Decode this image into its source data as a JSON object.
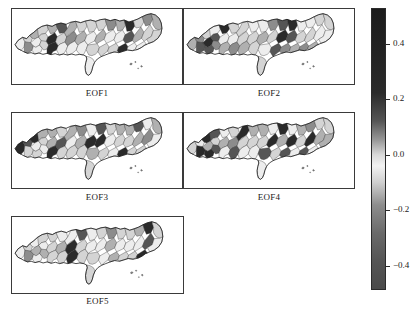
{
  "figure": {
    "width": 416,
    "height": 311,
    "background": "#ffffff"
  },
  "panels": [
    {
      "id": "eof1",
      "label": "EOF1",
      "frame": {
        "x": 11,
        "y": 8,
        "w": 172,
        "h": 77
      },
      "label_pos": {
        "x": 11,
        "y": 88,
        "w": 172
      }
    },
    {
      "id": "eof2",
      "label": "EOF2",
      "frame": {
        "x": 183,
        "y": 8,
        "w": 172,
        "h": 77
      },
      "label_pos": {
        "x": 183,
        "y": 88,
        "w": 172
      }
    },
    {
      "id": "eof3",
      "label": "EOF3",
      "frame": {
        "x": 11,
        "y": 112,
        "w": 172,
        "h": 77
      },
      "label_pos": {
        "x": 11,
        "y": 192,
        "w": 172
      }
    },
    {
      "id": "eof4",
      "label": "EOF4",
      "frame": {
        "x": 183,
        "y": 112,
        "w": 172,
        "h": 77
      },
      "label_pos": {
        "x": 183,
        "y": 192,
        "w": 172
      }
    },
    {
      "id": "eof5",
      "label": "EOF5",
      "frame": {
        "x": 11,
        "y": 216,
        "w": 173,
        "h": 78
      },
      "label_pos": {
        "x": 11,
        "y": 296,
        "w": 173
      }
    }
  ],
  "chart_data": {
    "type": "heatmap",
    "title": "",
    "xlabel": "",
    "ylabel": "",
    "panel_labels": [
      "EOF1",
      "EOF2",
      "EOF3",
      "EOF4",
      "EOF5"
    ],
    "colorbar": {
      "orientation": "vertical",
      "position": "right",
      "vmin": -0.49,
      "vmax": 0.53,
      "ticks": [
        0.4,
        0.2,
        0.0,
        -0.2,
        -0.4
      ],
      "tick_labels": [
        "0.4",
        "0.2",
        "0.0",
        "−0.2",
        "−0.4"
      ],
      "tick_y": [
        44,
        99,
        155,
        210,
        266
      ],
      "bar": {
        "x": 371,
        "y": 8,
        "w": 15,
        "h": 282
      },
      "colormap": "diverging-gray",
      "stops": [
        {
          "pos": 0.0,
          "color": "#1c1c1c"
        },
        {
          "pos": 0.16,
          "color": "#232323"
        },
        {
          "pos": 0.3,
          "color": "#2b2b2b"
        },
        {
          "pos": 0.4,
          "color": "#555555"
        },
        {
          "pos": 0.47,
          "color": "#9a9a9a"
        },
        {
          "pos": 0.52,
          "color": "#d8d8d8"
        },
        {
          "pos": 0.56,
          "color": "#f2f2f2"
        },
        {
          "pos": 0.62,
          "color": "#cfcfcf"
        },
        {
          "pos": 0.7,
          "color": "#8d8d8d"
        },
        {
          "pos": 0.8,
          "color": "#6a6a6a"
        },
        {
          "pos": 0.9,
          "color": "#555555"
        },
        {
          "pos": 1.0,
          "color": "#4a4a4a"
        }
      ]
    },
    "shade_levels": {
      "very_high": "#2a2a2a",
      "high": "#555555",
      "mid_high": "#8c8c8c",
      "mid": "#b0b0b0",
      "light": "#d4d4d4",
      "very_light": "#ededed",
      "white": "#fbfbfb"
    },
    "panel_regions": {
      "eof1": [
        "very_light",
        "light",
        "mid",
        "light",
        "mid_high",
        "very_light",
        "light",
        "mid",
        "very_light",
        "light",
        "very_high",
        "high",
        "very_high",
        "light",
        "mid",
        "very_light",
        "mid_high",
        "light",
        "very_light",
        "mid",
        "light",
        "very_light"
      ],
      "eof2": [
        "mid",
        "mid_high",
        "light",
        "very_light",
        "high",
        "very_high",
        "high",
        "very_high",
        "high",
        "mid_high",
        "very_light",
        "light",
        "mid",
        "very_light",
        "light",
        "mid_high",
        "light",
        "very_light",
        "mid",
        "light",
        "very_light",
        "light"
      ],
      "eof3": [
        "very_high",
        "high",
        "very_high",
        "mid",
        "light",
        "very_light",
        "light",
        "mid",
        "light",
        "very_light",
        "mid",
        "light",
        "very_high",
        "high",
        "mid",
        "light",
        "very_light",
        "mid_high",
        "light",
        "mid",
        "very_light",
        "light"
      ],
      "eof4": [
        "light",
        "very_light",
        "very_high",
        "high",
        "very_high",
        "mid",
        "light",
        "very_light",
        "very_high",
        "high",
        "mid",
        "light",
        "very_light",
        "mid_high",
        "very_high",
        "high",
        "light",
        "mid",
        "very_light",
        "light",
        "mid",
        "very_light"
      ],
      "eof5": [
        "very_light",
        "light",
        "very_light",
        "light",
        "mid_high",
        "mid",
        "very_light",
        "light",
        "very_light",
        "mid",
        "light",
        "very_light",
        "light",
        "mid",
        "very_light",
        "light",
        "very_high",
        "high",
        "very_high",
        "light",
        "very_light",
        "light"
      ]
    }
  }
}
